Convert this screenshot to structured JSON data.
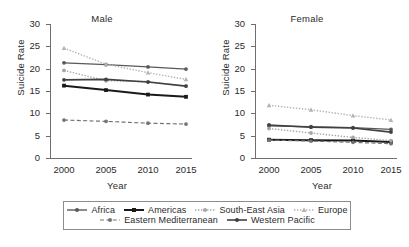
{
  "figure": {
    "xlabel": "Year",
    "ylabel": "Suicide Rate"
  },
  "panels": [
    {
      "title": "Male"
    },
    {
      "title": "Female"
    }
  ],
  "axis": {
    "yticks": [
      "0",
      "5",
      "10",
      "15",
      "20",
      "25",
      "30"
    ],
    "xticks": [
      "2000",
      "2005",
      "2010",
      "2015"
    ]
  },
  "legend": {
    "items": [
      {
        "label": "Africa",
        "color": "#595959",
        "style": "solid",
        "marker": "circle",
        "width": 1.4
      },
      {
        "label": "Americas",
        "color": "#1a1a1a",
        "style": "solid",
        "marker": "square",
        "width": 2.0
      },
      {
        "label": "South-East Asia",
        "color": "#a6a6a6",
        "style": "dotted",
        "marker": "circle",
        "width": 1.4
      },
      {
        "label": "Europe",
        "color": "#b3b3b3",
        "style": "dotted",
        "marker": "triangle",
        "width": 1.4
      },
      {
        "label": "Eastern Mediterranean",
        "color": "#737373",
        "style": "dashed",
        "marker": "circle",
        "width": 1.2
      },
      {
        "label": "Western Pacific",
        "color": "#404040",
        "style": "solid",
        "marker": "circle",
        "width": 1.6
      }
    ]
  },
  "chart_data": [
    {
      "type": "line",
      "title": "Male",
      "xlabel": "Year",
      "ylabel": "Suicide Rate",
      "x": [
        2000,
        2005,
        2010,
        2015
      ],
      "ylim": [
        0,
        30
      ],
      "ytick_step": 5,
      "grid": false,
      "legend_position": "bottom",
      "series": [
        {
          "name": "Africa",
          "values": [
            21.3,
            20.9,
            20.4,
            19.9
          ]
        },
        {
          "name": "Americas",
          "values": [
            16.2,
            15.2,
            14.2,
            13.7
          ]
        },
        {
          "name": "South-East Asia",
          "values": [
            19.6,
            17.3,
            17.1,
            16.1
          ]
        },
        {
          "name": "Europe",
          "values": [
            24.6,
            21.0,
            19.1,
            17.6
          ]
        },
        {
          "name": "Eastern Mediterranean",
          "values": [
            8.5,
            8.2,
            7.8,
            7.6
          ]
        },
        {
          "name": "Western Pacific",
          "values": [
            17.5,
            17.6,
            17.0,
            16.1
          ]
        }
      ]
    },
    {
      "type": "line",
      "title": "Female",
      "xlabel": "Year",
      "ylabel": "Suicide Rate",
      "x": [
        2000,
        2005,
        2010,
        2015
      ],
      "ylim": [
        0,
        30
      ],
      "ytick_step": 5,
      "grid": false,
      "legend_position": "bottom",
      "series": [
        {
          "name": "Africa",
          "values": [
            7.2,
            7.0,
            6.8,
            6.4
          ]
        },
        {
          "name": "Americas",
          "values": [
            4.1,
            4.0,
            3.9,
            3.6
          ]
        },
        {
          "name": "South-East Asia",
          "values": [
            6.6,
            5.6,
            4.6,
            3.9
          ]
        },
        {
          "name": "Europe",
          "values": [
            11.8,
            10.8,
            9.5,
            8.5
          ]
        },
        {
          "name": "Eastern Mediterranean",
          "values": [
            4.0,
            3.8,
            3.5,
            3.2
          ]
        },
        {
          "name": "Western Pacific",
          "values": [
            7.4,
            6.9,
            6.7,
            5.8
          ]
        }
      ]
    }
  ]
}
